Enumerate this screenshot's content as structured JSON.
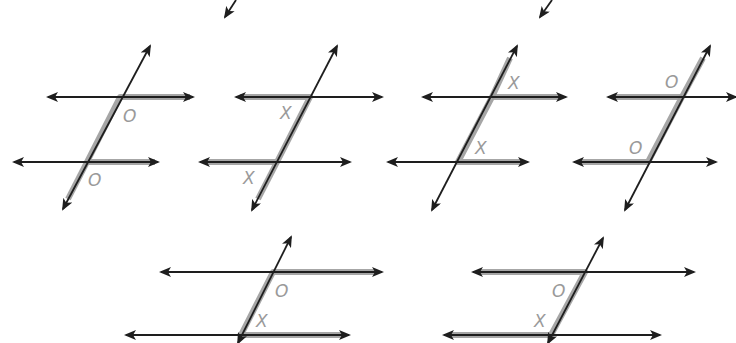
{
  "diagram": {
    "colors": {
      "line": "#1e1e1e",
      "highlight": "#9c9c9c",
      "label": "#9a9a9a",
      "background": "#ffffff"
    },
    "partial_arrows": [
      {
        "x1": 236,
        "y1": 0,
        "x2": 225,
        "y2": 17
      },
      {
        "x1": 552,
        "y1": 0,
        "x2": 540,
        "y2": 17
      }
    ],
    "figures": [
      {
        "id": "fig-1",
        "relationship": "corresponding angles",
        "top_line": {
          "x1": 48,
          "x2": 193,
          "y": 97
        },
        "bottom_line": {
          "x1": 14,
          "x2": 158,
          "y": 162
        },
        "transversal": {
          "x1": 63,
          "y1": 209,
          "x2": 150,
          "y2": 46
        },
        "highlight": [
          [
            190,
            97
          ],
          [
            120,
            97
          ],
          [
            87,
            162
          ],
          [
            155,
            162
          ]
        ],
        "highlight2": [
          [
            87,
            162
          ],
          [
            68,
            199
          ]
        ],
        "labels": [
          {
            "text": "O",
            "x": 123,
            "y": 122
          },
          {
            "text": "O",
            "x": 88,
            "y": 186
          }
        ]
      },
      {
        "id": "fig-2",
        "relationship": "corresponding angles",
        "top_line": {
          "x1": 236,
          "x2": 382,
          "y": 97
        },
        "bottom_line": {
          "x1": 200,
          "x2": 350,
          "y": 162
        },
        "transversal": {
          "x1": 252,
          "y1": 210,
          "x2": 337,
          "y2": 46
        },
        "highlight": [
          [
            240,
            97
          ],
          [
            310,
            97
          ],
          [
            277,
            162
          ],
          [
            205,
            162
          ]
        ],
        "highlight2": [
          [
            277,
            162
          ],
          [
            258,
            199
          ]
        ],
        "labels": [
          {
            "text": "X",
            "x": 280,
            "y": 119
          },
          {
            "text": "X",
            "x": 243,
            "y": 184
          }
        ]
      },
      {
        "id": "fig-3",
        "relationship": "corresponding angles",
        "top_line": {
          "x1": 423,
          "x2": 566,
          "y": 97
        },
        "bottom_line": {
          "x1": 388,
          "x2": 528,
          "y": 162
        },
        "transversal": {
          "x1": 432,
          "y1": 210,
          "x2": 517,
          "y2": 46
        },
        "highlight": [
          [
            510,
            58
          ],
          [
            492,
            97
          ],
          [
            458,
            162
          ],
          [
            523,
            162
          ]
        ],
        "highlight2": [
          [
            492,
            97
          ],
          [
            560,
            97
          ]
        ],
        "labels": [
          {
            "text": "X",
            "x": 508,
            "y": 89
          },
          {
            "text": "X",
            "x": 475,
            "y": 154
          }
        ]
      },
      {
        "id": "fig-4",
        "relationship": "corresponding angles",
        "top_line": {
          "x1": 608,
          "x2": 736,
          "y": 97
        },
        "bottom_line": {
          "x1": 574,
          "x2": 716,
          "y": 162
        },
        "transversal": {
          "x1": 625,
          "y1": 210,
          "x2": 710,
          "y2": 46
        },
        "highlight": [
          [
            703,
            58
          ],
          [
            682,
            97
          ],
          [
            648,
            162
          ],
          [
            580,
            162
          ]
        ],
        "highlight2": [
          [
            682,
            97
          ],
          [
            614,
            97
          ]
        ],
        "labels": [
          {
            "text": "O",
            "x": 665,
            "y": 88
          },
          {
            "text": "O",
            "x": 629,
            "y": 154
          }
        ]
      },
      {
        "id": "fig-5",
        "relationship": "same-side interior angles",
        "top_line": {
          "x1": 161,
          "x2": 382,
          "y": 272
        },
        "bottom_line": {
          "x1": 126,
          "x2": 349,
          "y": 335
        },
        "transversal": {
          "x1": 238,
          "y1": 343,
          "x2": 291,
          "y2": 237
        },
        "highlight": [
          [
            376,
            272
          ],
          [
            273,
            272
          ],
          [
            241,
            335
          ],
          [
            343,
            335
          ]
        ],
        "highlight2": [],
        "labels": [
          {
            "text": "O",
            "x": 275,
            "y": 297
          },
          {
            "text": "X",
            "x": 256,
            "y": 327
          }
        ]
      },
      {
        "id": "fig-6",
        "relationship": "same-side interior angles",
        "top_line": {
          "x1": 473,
          "x2": 694,
          "y": 272
        },
        "bottom_line": {
          "x1": 444,
          "x2": 660,
          "y": 335
        },
        "transversal": {
          "x1": 548,
          "y1": 343,
          "x2": 603,
          "y2": 238
        },
        "highlight": [
          [
            479,
            272
          ],
          [
            585,
            272
          ],
          [
            551,
            335
          ],
          [
            450,
            335
          ]
        ],
        "highlight2": [],
        "labels": [
          {
            "text": "O",
            "x": 552,
            "y": 297
          },
          {
            "text": "X",
            "x": 534,
            "y": 327
          }
        ]
      }
    ]
  }
}
